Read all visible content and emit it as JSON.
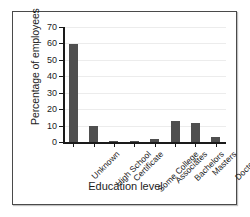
{
  "chart_data": {
    "type": "bar",
    "title": "",
    "xlabel": "Education level",
    "ylabel": "Percentage of employees",
    "categories": [
      "Unknown",
      "High School",
      "Certificate",
      "Some College",
      "Associates",
      "Bachelors",
      "Masters",
      "Doctorate"
    ],
    "values": [
      59.8,
      9.7,
      0.7,
      0.2,
      1.7,
      12.5,
      11.5,
      3.3
    ],
    "ylim": [
      0,
      70
    ],
    "yticks": [
      0,
      10,
      20,
      30,
      40,
      50,
      60,
      70
    ],
    "ytick_labels": [
      "0",
      "10",
      "20",
      "30",
      "40",
      "50",
      "60",
      "70"
    ],
    "grid": true,
    "grid_axis": "y",
    "legend": false,
    "bar_color": "#4f4f4f",
    "axis_color": "#1a1a1a",
    "gridline_color": "#ececec"
  }
}
